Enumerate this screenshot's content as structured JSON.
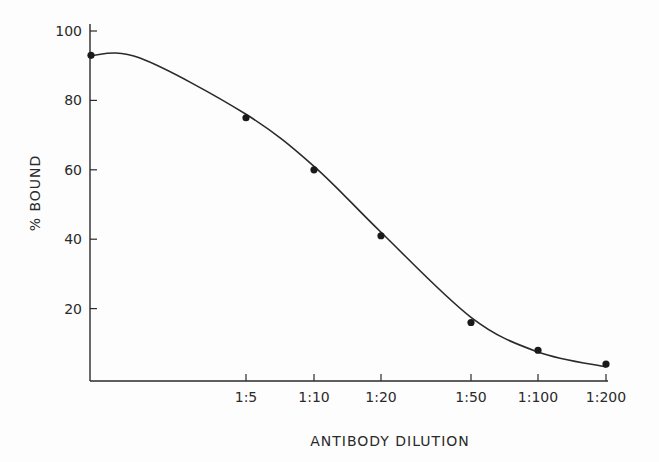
{
  "chart_data": {
    "type": "line",
    "title": "",
    "xlabel": "ANTIBODY DILUTION",
    "ylabel": "% BOUND",
    "x_scale": "log",
    "x_tick_labels": [
      "1:5",
      "1:10",
      "1:20",
      "1:50",
      "1:100",
      "1:200"
    ],
    "y_ticks": [
      20,
      40,
      60,
      80,
      100
    ],
    "ylim": [
      0,
      100
    ],
    "grid": false,
    "legend": null,
    "series": [
      {
        "name": "% Bound",
        "style": "points with smooth fitted curve",
        "x": [
          "undiluted",
          "1:5",
          "1:10",
          "1:20",
          "1:50",
          "1:100",
          "1:200"
        ],
        "values": [
          93,
          75,
          60,
          41,
          16,
          8,
          4
        ]
      }
    ]
  }
}
